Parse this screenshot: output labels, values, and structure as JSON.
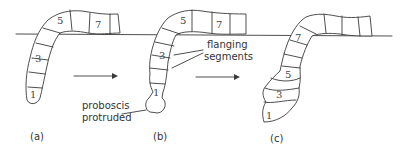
{
  "figure": {
    "panels": [
      {
        "id": "a",
        "caption": "(a)",
        "segment_labels": [
          "1",
          "3",
          "5",
          "7"
        ]
      },
      {
        "id": "b",
        "caption": "(b)",
        "segment_labels": [
          "1",
          "3",
          "5",
          "7"
        ]
      },
      {
        "id": "c",
        "caption": "(c)",
        "segment_labels": [
          "1",
          "3",
          "5",
          "7"
        ]
      }
    ],
    "annotations": {
      "proboscis_line1": "proboscis",
      "proboscis_line2": "protruded",
      "flanging_line1": "flanging",
      "flanging_line2": "segments"
    },
    "arrows": [
      "a-to-b",
      "b-to-c"
    ],
    "colors": {
      "line": "#3a3a3a",
      "background": "#ffffff"
    }
  }
}
